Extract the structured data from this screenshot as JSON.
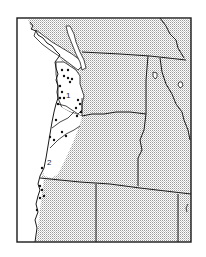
{
  "map": {
    "title": "Distribution map, Pacific Northwest",
    "colors": {
      "ink": "#1a1a1a",
      "stipple": "#9a9a9a",
      "paper": "#ffffff",
      "dot": "#111111"
    },
    "zone_labels": [
      {
        "id": "zone-1",
        "text": "1"
      },
      {
        "id": "zone-2",
        "text": "2"
      }
    ],
    "legend": {
      "stippled": "range outside coastal zones",
      "white": "coastal zones 1 and 2",
      "dots": "collection localities"
    }
  }
}
